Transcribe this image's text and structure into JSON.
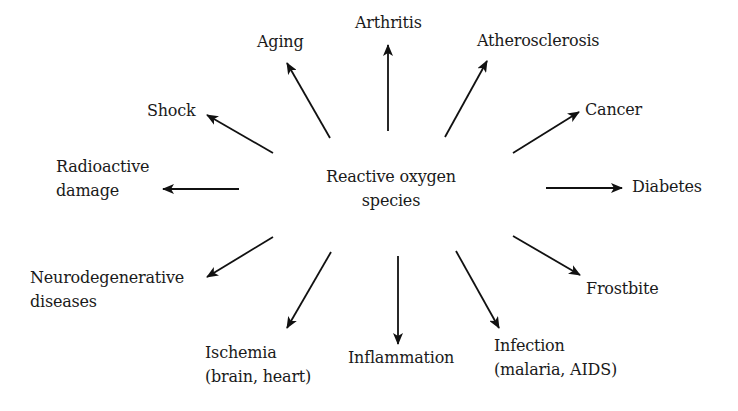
{
  "diagram": {
    "center": {
      "lines": [
        "Reactive oxygen",
        "species"
      ]
    },
    "arrow_color": "#111111",
    "nodes": [
      {
        "id": "aging",
        "lines": [
          "Aging"
        ],
        "x": 257,
        "y": 30,
        "arrow": {
          "x1": 330,
          "y1": 138,
          "x2": 287,
          "y2": 63
        }
      },
      {
        "id": "arthritis",
        "lines": [
          "Arthritis"
        ],
        "x": 355,
        "y": 11,
        "arrow": {
          "x1": 388,
          "y1": 131,
          "x2": 388,
          "y2": 45
        }
      },
      {
        "id": "atherosclerosis",
        "lines": [
          "Atherosclerosis"
        ],
        "x": 477,
        "y": 29,
        "arrow": {
          "x1": 445,
          "y1": 137,
          "x2": 487,
          "y2": 61
        }
      },
      {
        "id": "shock",
        "lines": [
          "Shock"
        ],
        "x": 147,
        "y": 99,
        "arrow": {
          "x1": 273,
          "y1": 153,
          "x2": 207,
          "y2": 115
        }
      },
      {
        "id": "cancer",
        "lines": [
          "Cancer"
        ],
        "x": 585,
        "y": 98,
        "arrow": {
          "x1": 513,
          "y1": 153,
          "x2": 579,
          "y2": 112
        }
      },
      {
        "id": "radioactive-damage",
        "lines": [
          "Radioactive",
          "damage"
        ],
        "x": 56,
        "y": 155,
        "arrow": {
          "x1": 239,
          "y1": 189,
          "x2": 163,
          "y2": 189
        }
      },
      {
        "id": "diabetes",
        "lines": [
          "Diabetes"
        ],
        "x": 632,
        "y": 175,
        "arrow": {
          "x1": 546,
          "y1": 188,
          "x2": 622,
          "y2": 188
        }
      },
      {
        "id": "neurodegenerative-diseases",
        "lines": [
          "Neurodegenerative",
          "diseases"
        ],
        "x": 30,
        "y": 266,
        "arrow": {
          "x1": 273,
          "y1": 237,
          "x2": 207,
          "y2": 277
        }
      },
      {
        "id": "frostbite",
        "lines": [
          "Frostbite"
        ],
        "x": 586,
        "y": 277,
        "arrow": {
          "x1": 513,
          "y1": 236,
          "x2": 580,
          "y2": 275
        }
      },
      {
        "id": "ischemia",
        "lines": [
          "Ischemia",
          "(brain, heart)"
        ],
        "x": 205,
        "y": 341,
        "arrow": {
          "x1": 331,
          "y1": 252,
          "x2": 287,
          "y2": 328
        }
      },
      {
        "id": "inflammation",
        "lines": [
          "Inflammation"
        ],
        "x": 348,
        "y": 346,
        "arrow": {
          "x1": 398,
          "y1": 256,
          "x2": 398,
          "y2": 344
        }
      },
      {
        "id": "infection",
        "lines": [
          "Infection",
          "(malaria, AIDS)"
        ],
        "x": 494,
        "y": 334,
        "arrow": {
          "x1": 456,
          "y1": 251,
          "x2": 499,
          "y2": 328
        }
      }
    ]
  }
}
